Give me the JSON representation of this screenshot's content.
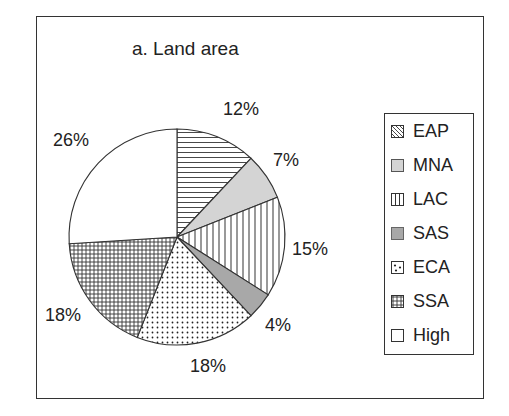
{
  "chart_data": {
    "type": "pie",
    "title": "a. Land area",
    "categories": [
      "EAP",
      "MNA",
      "LAC",
      "SAS",
      "ECA",
      "SSA",
      "High"
    ],
    "values": [
      12,
      7,
      15,
      4,
      18,
      18,
      26
    ],
    "value_labels": [
      "12%",
      "7%",
      "15%",
      "4%",
      "18%",
      "18%",
      "26%"
    ],
    "patterns": [
      "horizontal-lines",
      "light-gray",
      "vertical-lines",
      "mid-gray",
      "dots",
      "grid",
      "white"
    ],
    "start_angle_deg": 0,
    "direction": "clockwise",
    "legend_position": "right"
  },
  "legend": {
    "items": [
      {
        "label": "EAP"
      },
      {
        "label": "MNA"
      },
      {
        "label": "LAC"
      },
      {
        "label": "SAS"
      },
      {
        "label": "ECA"
      },
      {
        "label": "SSA"
      },
      {
        "label": "High"
      }
    ]
  }
}
